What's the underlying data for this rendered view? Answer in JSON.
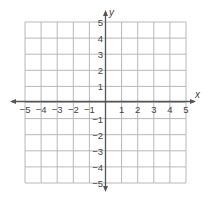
{
  "graph": {
    "x_axis_label": "x",
    "y_axis_label": "y",
    "x_min": -5,
    "x_max": 5,
    "y_min": -5,
    "y_max": 5,
    "x_ticks": [
      "−5",
      "−4",
      "−3",
      "−2",
      "−1",
      "1",
      "2",
      "3",
      "4",
      "5"
    ],
    "y_ticks_pos": [
      "5",
      "4",
      "3",
      "2",
      "1"
    ],
    "y_ticks_neg": [
      "−1",
      "−2",
      "−3",
      "−4",
      "−5"
    ],
    "grid_color": "#b8b8b8",
    "axis_color": "#555555"
  }
}
